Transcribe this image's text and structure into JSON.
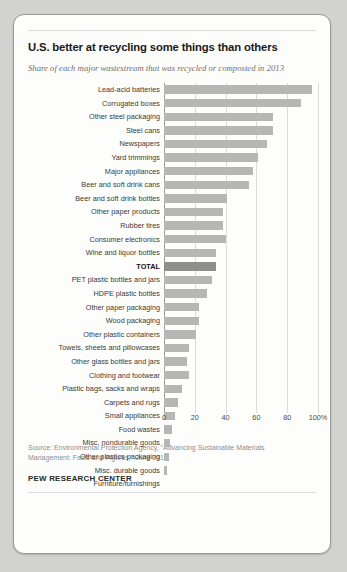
{
  "card": {
    "title": "U.S. better at recycling some things than others",
    "subtitle": "Share of each major wastestream that was recycled or composted in 2013",
    "source": "Source: Environmental Protection Agency, \"Advancing Sustainable Materials Management: Facts and Figures,\" June 2015.",
    "brand": "PEW RESEARCH CENTER"
  },
  "chart_data": {
    "type": "bar",
    "orientation": "horizontal",
    "title": "U.S. better at recycling some things than others",
    "subtitle": "Share of each major wastestream that was recycled or composted in 2013",
    "xlabel": "",
    "ylabel": "",
    "xlim": [
      0,
      100
    ],
    "grid": true,
    "legend": false,
    "tick_labels": [
      "0",
      "20",
      "40",
      "60",
      "80",
      "100%"
    ],
    "tick_values": [
      0,
      20,
      40,
      60,
      80,
      100
    ],
    "highlight_category": "TOTAL",
    "bar_color": "#b6b6b4",
    "highlight_color": "#8e8e8c",
    "categories": [
      "Lead-acid batteries",
      "Corrugated boxes",
      "Other steel packaging",
      "Steel cans",
      "Newspapers",
      "Yard trimmings",
      "Major appliances",
      "Beer and soft drink cans",
      "Beer and soft drink bottles",
      "Other paper products",
      "Rubber tires",
      "Consumer electronics",
      "Wine and liquor bottles",
      "TOTAL",
      "PET plastic bottles and jars",
      "HDPE plastic bottles",
      "Other paper packaging",
      "Wood packaging",
      "Other plastic containers",
      "Towels, sheets and pillowcases",
      "Other glass bottles and jars",
      "Clothing and footwear",
      "Plastic bags, sacks and wraps",
      "Carpets and rugs",
      "Small appliances",
      "Food wastes",
      "Misc. nondurable goods",
      "Other plastics packaging",
      "Misc. durable goods",
      "Furniture/furnishings"
    ],
    "values": [
      96,
      89,
      71,
      71,
      67,
      61,
      58,
      55,
      41,
      38,
      38,
      40,
      34,
      34,
      31,
      28,
      23,
      23,
      21,
      16,
      15,
      16,
      12,
      9,
      7,
      5,
      4,
      3,
      2,
      0
    ]
  }
}
